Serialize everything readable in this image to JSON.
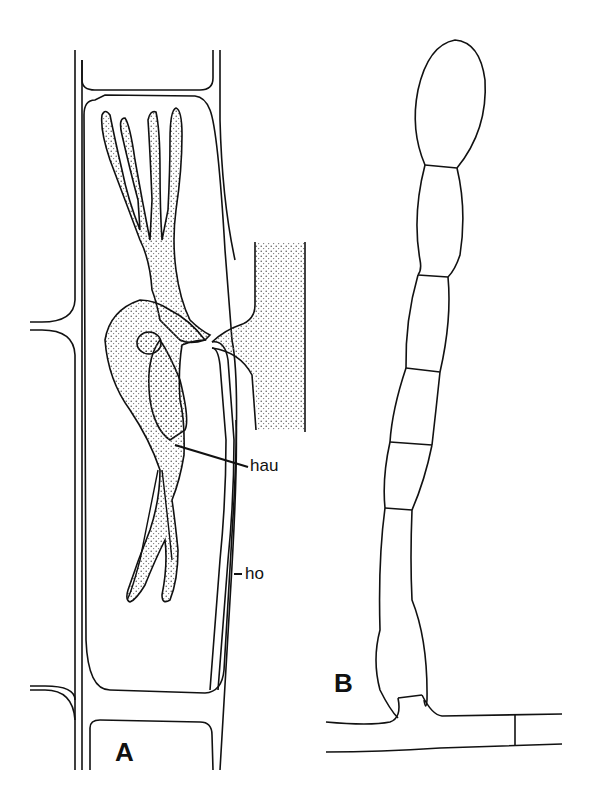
{
  "figure": {
    "panels": [
      {
        "id": "A",
        "label": "A",
        "annotations": [
          {
            "id": "hau",
            "text": "hau"
          },
          {
            "id": "ho",
            "text": "ho"
          }
        ]
      },
      {
        "id": "B",
        "label": "B"
      }
    ]
  },
  "colors": {
    "ink": "#111111",
    "background": "#ffffff",
    "stipple": "#444444"
  }
}
